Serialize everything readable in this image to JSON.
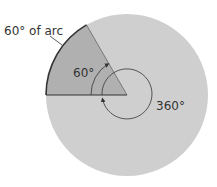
{
  "diagram": {
    "arc_label": "60° of arc",
    "angle_label": "60°",
    "full_label": "360°",
    "colors": {
      "circle_fill": "#cfcfcf",
      "wedge_fill": "#b0b0b0",
      "stroke": "#333333",
      "text": "#333333"
    },
    "geometry": {
      "center": [
        127,
        95
      ],
      "radius": 81,
      "wedge_start_deg": 120,
      "wedge_end_deg": 180,
      "inner_circle_radius": 25
    }
  }
}
